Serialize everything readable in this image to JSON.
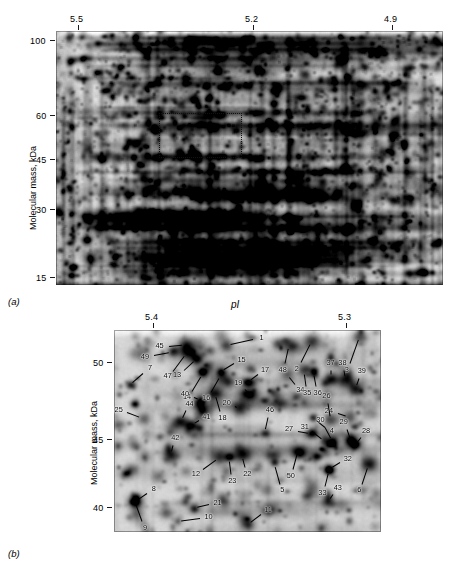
{
  "figure": {
    "panels": [
      {
        "id": "a",
        "caption": "(a)",
        "y_axis_title": "Molecular mass, kDa",
        "y_ticks": [
          "100",
          "60",
          "45",
          "30",
          "15"
        ],
        "x_ticks": [
          "5.5",
          "5.2",
          "4.9"
        ],
        "x_axis_title": ""
      },
      {
        "id": "b",
        "caption": "(b)",
        "y_axis_title": "Molecular mass, kDa",
        "y_ticks": [
          "50",
          "45",
          "40"
        ],
        "x_ticks": [
          "5.4",
          "5.3"
        ],
        "x_axis_title": "pI"
      }
    ],
    "spot_labels": [
      "1",
      "2",
      "3",
      "4",
      "5",
      "6",
      "7",
      "8",
      "9",
      "10",
      "11",
      "12",
      "13",
      "14",
      "15",
      "16",
      "17",
      "18",
      "19",
      "20",
      "21",
      "22",
      "23",
      "24",
      "25",
      "26",
      "27",
      "28",
      "29",
      "30",
      "31",
      "32",
      "33",
      "34",
      "35",
      "36",
      "37",
      "38",
      "39",
      "40",
      "41",
      "42",
      "43",
      "44",
      "45",
      "46",
      "47",
      "48",
      "49",
      "50"
    ]
  },
  "chart_data": {
    "type": "scatter",
    "subtitle": "",
    "panels": [
      {
        "id": "a",
        "caption": "(a)",
        "description": "Full 2-DE gel, silver stained, whole pI and molecular-mass range",
        "xlabel": "pI",
        "ylabel": "Molecular mass, kDa",
        "x_tick_labels": [
          "5.5",
          "5.2",
          "4.9"
        ],
        "x_tick_px_fraction": [
          0.205,
          0.572,
          0.885
        ],
        "y_tick_labels": [
          "100",
          "60",
          "45",
          "30",
          "15"
        ],
        "y_tick_px_fraction": [
          0.035,
          0.327,
          0.497,
          0.692,
          0.955
        ],
        "xlim": [
          5.7,
          4.75
        ],
        "ylim": [
          14,
          110
        ],
        "grid": false,
        "legend": "none",
        "roi_box": {
          "note": "dotted rectangle marks the region magnified in panel (b)",
          "x_fraction": [
            0.333,
            0.545
          ],
          "y_fraction": [
            0.316,
            0.473
          ],
          "pi_range": [
            5.45,
            5.25
          ],
          "mass_range_kda": [
            38,
            62
          ]
        }
      },
      {
        "id": "b",
        "caption": "(b)",
        "description": "Magnified region of the gel showing 50 annotated protein spots",
        "xlabel": "pI",
        "ylabel": "Molecular mass, kDa",
        "x_tick_labels": [
          "5.4",
          "5.3"
        ],
        "x_tick_px_fraction": [
          0.195,
          0.8
        ],
        "y_tick_labels": [
          "50",
          "45",
          "40"
        ],
        "y_tick_px_fraction": [
          0.115,
          0.535,
          0.905
        ],
        "xlim": [
          5.44,
          5.27
        ],
        "ylim": [
          39.0,
          51.5
        ],
        "grid": false,
        "legend": "none",
        "points": [
          {
            "label": "1",
            "x": 0.42,
            "y": 0.075,
            "pi": 5.368,
            "mass": 51.1,
            "lx": 0.52,
            "ly": 0.046
          },
          {
            "label": "2",
            "x": 0.74,
            "y": 0.055,
            "pi": 5.314,
            "mass": 51.3,
            "lx": 0.7,
            "ly": 0.16
          },
          {
            "label": "3",
            "x": 0.92,
            "y": 0.03,
            "pi": 5.284,
            "mass": 51.6,
            "lx": 0.884,
            "ly": 0.164
          },
          {
            "label": "4",
            "x": 0.745,
            "y": 0.432,
            "pi": 5.313,
            "mass": 46.5,
            "lx": 0.79,
            "ly": 0.48
          },
          {
            "label": "5",
            "x": 0.6,
            "y": 0.655,
            "pi": 5.338,
            "mass": 44.0,
            "lx": 0.622,
            "ly": 0.76
          },
          {
            "label": "6",
            "x": 0.955,
            "y": 0.66,
            "pi": 5.278,
            "mass": 43.9,
            "lx": 0.93,
            "ly": 0.76
          },
          {
            "label": "7",
            "x": 0.06,
            "y": 0.27,
            "pi": 5.43,
            "mass": 48.3,
            "lx": 0.11,
            "ly": 0.212
          },
          {
            "label": "8",
            "x": 0.078,
            "y": 0.848,
            "pi": 5.427,
            "mass": 40.9,
            "lx": 0.122,
            "ly": 0.808
          },
          {
            "label": "9",
            "x": 0.078,
            "y": 0.848,
            "pi": 5.427,
            "mass": 40.9,
            "lx": 0.105,
            "ly": 0.947
          },
          {
            "label": "10",
            "x": 0.238,
            "y": 0.945,
            "pi": 5.4,
            "mass": 39.6,
            "lx": 0.322,
            "ly": 0.93
          },
          {
            "label": "11",
            "x": 0.5,
            "y": 0.962,
            "pi": 5.355,
            "mass": 39.4,
            "lx": 0.552,
            "ly": 0.91
          },
          {
            "label": "12",
            "x": 0.395,
            "y": 0.632,
            "pi": 5.373,
            "mass": 44.2,
            "lx": 0.335,
            "ly": 0.69
          },
          {
            "label": "13",
            "x": 0.31,
            "y": 0.142,
            "pi": 5.387,
            "mass": 50.4,
            "lx": 0.262,
            "ly": 0.2
          },
          {
            "label": "14",
            "x": 0.333,
            "y": 0.21,
            "pi": 5.383,
            "mass": 49.7,
            "lx": 0.292,
            "ly": 0.3
          },
          {
            "label": "15",
            "x": 0.4,
            "y": 0.205,
            "pi": 5.372,
            "mass": 49.8,
            "lx": 0.45,
            "ly": 0.165
          },
          {
            "label": "16",
            "x": 0.4,
            "y": 0.222,
            "pi": 5.372,
            "mass": 49.6,
            "lx": 0.363,
            "ly": 0.308
          },
          {
            "label": "17",
            "x": 0.5,
            "y": 0.258,
            "pi": 5.355,
            "mass": 49.2,
            "lx": 0.54,
            "ly": 0.218
          },
          {
            "label": "18",
            "x": 0.378,
            "y": 0.308,
            "pi": 5.376,
            "mass": 48.6,
            "lx": 0.398,
            "ly": 0.4
          },
          {
            "label": "19",
            "x": 0.51,
            "y": 0.318,
            "pi": 5.353,
            "mass": 48.5,
            "lx": 0.49,
            "ly": 0.29
          },
          {
            "label": "20",
            "x": 0.47,
            "y": 0.392,
            "pi": 5.36,
            "mass": 47.7,
            "lx": 0.452,
            "ly": 0.378
          },
          {
            "label": "21",
            "x": 0.298,
            "y": 0.88,
            "pi": 5.39,
            "mass": 40.5,
            "lx": 0.356,
            "ly": 0.862
          },
          {
            "label": "22",
            "x": 0.48,
            "y": 0.618,
            "pi": 5.358,
            "mass": 44.4,
            "lx": 0.492,
            "ly": 0.68
          },
          {
            "label": "23",
            "x": 0.432,
            "y": 0.628,
            "pi": 5.367,
            "mass": 44.3,
            "lx": 0.44,
            "ly": 0.712
          },
          {
            "label": "24",
            "x": 0.88,
            "y": 0.43,
            "pi": 5.293,
            "mass": 46.5,
            "lx": 0.838,
            "ly": 0.412
          },
          {
            "label": "25",
            "x": 0.11,
            "y": 0.438,
            "pi": 5.422,
            "mass": 46.4,
            "lx": 0.05,
            "ly": 0.408
          },
          {
            "label": "26",
            "x": 0.812,
            "y": 0.442,
            "pi": 5.303,
            "mass": 46.3,
            "lx": 0.802,
            "ly": 0.36
          },
          {
            "label": "27",
            "x": 0.74,
            "y": 0.51,
            "pi": 5.314,
            "mass": 45.6,
            "lx": 0.69,
            "ly": 0.498
          },
          {
            "label": "28",
            "x": 0.905,
            "y": 0.565,
            "pi": 5.286,
            "mass": 45.0,
            "lx": 0.925,
            "ly": 0.53
          },
          {
            "label": "29",
            "x": 0.888,
            "y": 0.552,
            "pi": 5.289,
            "mass": 45.1,
            "lx": 0.872,
            "ly": 0.49
          },
          {
            "label": "30",
            "x": 0.818,
            "y": 0.548,
            "pi": 5.302,
            "mass": 45.2,
            "lx": 0.79,
            "ly": 0.478
          },
          {
            "label": "31",
            "x": 0.79,
            "y": 0.552,
            "pi": 5.307,
            "mass": 45.1,
            "lx": 0.742,
            "ly": 0.502
          },
          {
            "label": "32",
            "x": 0.805,
            "y": 0.69,
            "pi": 5.304,
            "mass": 43.7,
            "lx": 0.848,
            "ly": 0.655
          },
          {
            "label": "33",
            "x": 0.805,
            "y": 0.692,
            "pi": 5.304,
            "mass": 43.6,
            "lx": 0.79,
            "ly": 0.772
          },
          {
            "label": "34",
            "x": 0.648,
            "y": 0.218,
            "pi": 5.326,
            "mass": 49.6,
            "lx": 0.678,
            "ly": 0.268
          },
          {
            "label": "35",
            "x": 0.712,
            "y": 0.2,
            "pi": 5.317,
            "mass": 49.8,
            "lx": 0.72,
            "ly": 0.278
          },
          {
            "label": "36",
            "x": 0.748,
            "y": 0.205,
            "pi": 5.311,
            "mass": 49.8,
            "lx": 0.758,
            "ly": 0.278
          },
          {
            "label": "37",
            "x": 0.812,
            "y": 0.24,
            "pi": 5.303,
            "mass": 49.4,
            "lx": 0.812,
            "ly": 0.198
          },
          {
            "label": "38",
            "x": 0.868,
            "y": 0.248,
            "pi": 5.294,
            "mass": 49.3,
            "lx": 0.862,
            "ly": 0.198
          },
          {
            "label": "39",
            "x": 0.905,
            "y": 0.288,
            "pi": 5.287,
            "mass": 48.8,
            "lx": 0.918,
            "ly": 0.238
          },
          {
            "label": "40",
            "x": 0.325,
            "y": 0.345,
            "pi": 5.384,
            "mass": 48.2,
            "lx": 0.298,
            "ly": 0.33
          },
          {
            "label": "41",
            "x": 0.29,
            "y": 0.47,
            "pi": 5.39,
            "mass": 46.9,
            "lx": 0.318,
            "ly": 0.448
          },
          {
            "label": "42",
            "x": 0.212,
            "y": 0.618,
            "pi": 5.404,
            "mass": 44.4,
            "lx": 0.222,
            "ly": 0.568
          },
          {
            "label": "43",
            "x": 0.8,
            "y": 0.85,
            "pi": 5.305,
            "mass": 40.9,
            "lx": 0.82,
            "ly": 0.812
          },
          {
            "label": "44",
            "x": 0.252,
            "y": 0.45,
            "pi": 5.397,
            "mass": 47.1,
            "lx": 0.27,
            "ly": 0.398
          },
          {
            "label": "45",
            "x": 0.268,
            "y": 0.07,
            "pi": 5.395,
            "mass": 51.2,
            "lx": 0.205,
            "ly": 0.078
          },
          {
            "label": "46",
            "x": 0.565,
            "y": 0.508,
            "pi": 5.344,
            "mass": 45.6,
            "lx": 0.578,
            "ly": 0.43
          },
          {
            "label": "47",
            "x": 0.272,
            "y": 0.112,
            "pi": 5.394,
            "mass": 50.7,
            "lx": 0.222,
            "ly": 0.202
          },
          {
            "label": "48",
            "x": 0.655,
            "y": 0.075,
            "pi": 5.325,
            "mass": 51.1,
            "lx": 0.64,
            "ly": 0.165
          },
          {
            "label": "49",
            "x": 0.22,
            "y": 0.108,
            "pi": 5.403,
            "mass": 50.8,
            "lx": 0.15,
            "ly": 0.125
          },
          {
            "label": "50",
            "x": 0.69,
            "y": 0.6,
            "pi": 5.322,
            "mass": 44.6,
            "lx": 0.672,
            "ly": 0.69
          }
        ]
      }
    ]
  }
}
